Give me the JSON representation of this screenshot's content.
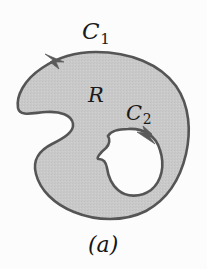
{
  "figure": {
    "caption": "(a)",
    "background_color": "#fcfcfc",
    "region": {
      "name": "R",
      "label": "R",
      "fill_color": "#c8c8c8",
      "stroke_color": "#555555",
      "description": "shaded multiply-connected planar region"
    },
    "hole": {
      "fill_color": "#ffffff",
      "stroke_color": "#555555",
      "description": "bean-shaped hole inside the shaded region"
    },
    "curves": [
      {
        "id": "C1",
        "label_main": "C",
        "label_sub": "1",
        "role": "outer-boundary",
        "orientation": "counterclockwise",
        "arrow_icon": "arrowhead-left-icon"
      },
      {
        "id": "C2",
        "label_main": "C",
        "label_sub": "2",
        "role": "inner-boundary",
        "orientation": "clockwise",
        "arrow_icon": "arrowhead-down-right-icon"
      }
    ]
  }
}
